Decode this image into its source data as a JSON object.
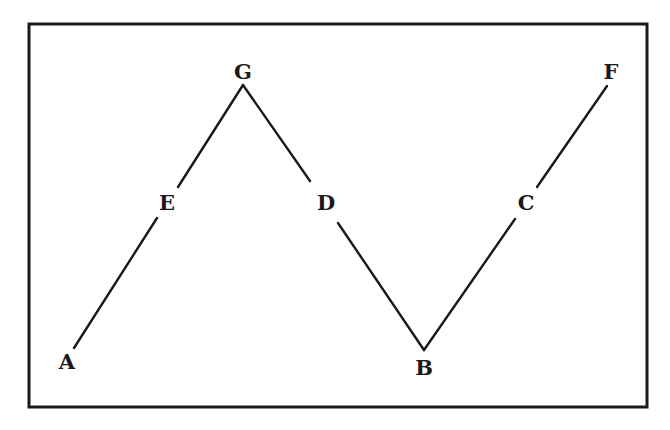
{
  "figure": {
    "frame": {
      "x": 29,
      "y": 24,
      "width": 618,
      "height": 383,
      "stroke": "#1a1a1a"
    },
    "line_color": "#1a1a1a",
    "points": [
      {
        "label": "A",
        "x": 67,
        "y": 362
      },
      {
        "label": "E",
        "x": 167,
        "y": 203
      },
      {
        "label": "G",
        "x": 243,
        "y": 72
      },
      {
        "label": "D",
        "x": 326,
        "y": 203
      },
      {
        "label": "B",
        "x": 424,
        "y": 368
      },
      {
        "label": "C",
        "x": 526,
        "y": 203
      },
      {
        "label": "F",
        "x": 611,
        "y": 72
      }
    ],
    "segments": [
      {
        "name": "A-E",
        "x1": 74,
        "y1": 348,
        "x2": 157,
        "y2": 218
      },
      {
        "name": "E-G",
        "x1": 178,
        "y1": 187,
        "x2": 243,
        "y2": 85
      },
      {
        "name": "G-D",
        "x1": 243,
        "y1": 85,
        "x2": 310,
        "y2": 181
      },
      {
        "name": "D-B",
        "x1": 338,
        "y1": 223,
        "x2": 424,
        "y2": 350
      },
      {
        "name": "B-C",
        "x1": 424,
        "y1": 350,
        "x2": 515,
        "y2": 219
      },
      {
        "name": "C-F",
        "x1": 537,
        "y1": 187,
        "x2": 607,
        "y2": 86
      }
    ]
  }
}
